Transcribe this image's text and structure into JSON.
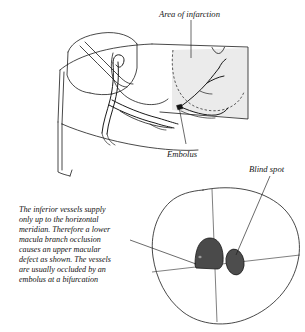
{
  "figure": {
    "title_labels": {
      "area_of_infarction": "Area of infarction",
      "embolus": "Embolus",
      "blind_spot": "Blind spot"
    },
    "caption_lines": [
      "The inferior vessels supply",
      "only up to the horizontal",
      "meridian.  Therefore a lower",
      "macula branch occlusion",
      "causes an upper macular",
      "defect as shown.  The vessels",
      "are usually occluded by an",
      "embolus at a bifurcation"
    ],
    "caption_full": "The inferior vessels supply only up to the horizontal meridian. Therefore a lower macula branch occlusion causes an upper macular defect as shown. The vessels are usually occluded by an embolus at a bifurcation",
    "colors": {
      "background": "#ffffff",
      "ink": "#1b1b1b",
      "infarction_fill": "#e9e9e9",
      "defect_fill": "#4a4a4a",
      "blind_spot_fill": "#4d4d4d",
      "embolus_dot": "#111111"
    }
  }
}
